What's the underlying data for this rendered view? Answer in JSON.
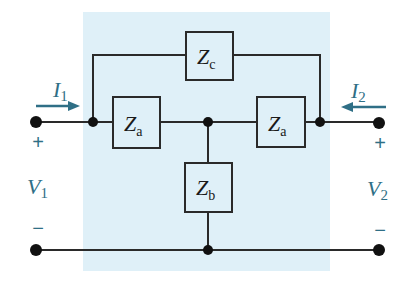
{
  "diagram": {
    "type": "two-port network (bridged-T)",
    "colors": {
      "background": "#ffffff",
      "network_fill": "#dff0f8",
      "wire": "#2a2a2a",
      "node": "#111111",
      "annotation": "#2f6f86"
    },
    "components": [
      {
        "id": "za_left",
        "symbol": "Z",
        "subscript": "a"
      },
      {
        "id": "za_right",
        "symbol": "Z",
        "subscript": "a"
      },
      {
        "id": "zb",
        "symbol": "Z",
        "subscript": "b"
      },
      {
        "id": "zc",
        "symbol": "Z",
        "subscript": "c"
      }
    ],
    "ports": {
      "input": {
        "current": {
          "symbol": "I",
          "subscript": "1",
          "direction": "right"
        },
        "voltage": {
          "symbol": "V",
          "subscript": "1"
        },
        "plus": "+",
        "minus": "−"
      },
      "output": {
        "current": {
          "symbol": "I",
          "subscript": "2",
          "direction": "left"
        },
        "voltage": {
          "symbol": "V",
          "subscript": "2"
        },
        "plus": "+",
        "minus": "−"
      }
    }
  }
}
